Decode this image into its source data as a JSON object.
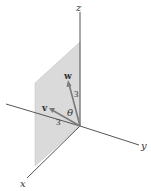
{
  "figure": {
    "axes": {
      "x_label": "x",
      "y_label": "y",
      "z_label": "z"
    },
    "vectors": [
      {
        "name": "v",
        "length_label": "3"
      },
      {
        "name": "w",
        "length_label": "3"
      }
    ],
    "angle_label": "θ",
    "colors": {
      "plane_fill": "#d9d9d9",
      "axis": "#555555",
      "vector": "#7a7a7a"
    }
  }
}
